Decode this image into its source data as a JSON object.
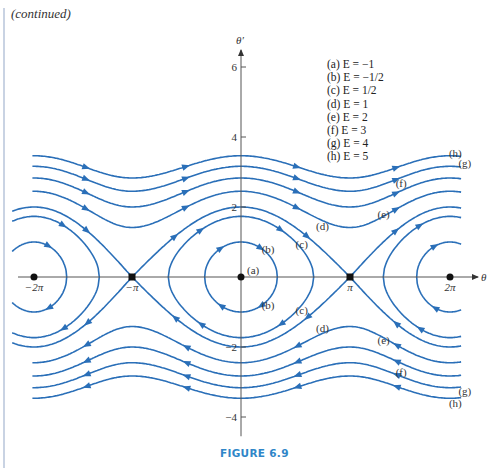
{
  "page": {
    "continued_label": "(continued)",
    "figure_caption": "FIGURE 6.9"
  },
  "colors": {
    "curve": "#2a6fb8",
    "axis": "#555555",
    "caption": "#2f86c8"
  },
  "chart_data": {
    "type": "line",
    "xlabel": "θ",
    "ylabel": "θ′",
    "xlim": [
      -6.6,
      6.9
    ],
    "ylim": [
      -4.6,
      6.6
    ],
    "x_ticks": [
      {
        "value": -6.2832,
        "label": "−2π"
      },
      {
        "value": -3.1416,
        "label": "−π"
      },
      {
        "value": 3.1416,
        "label": "π"
      },
      {
        "value": 6.2832,
        "label": "2π"
      }
    ],
    "y_ticks": [
      {
        "value": 6,
        "label": "6"
      },
      {
        "value": 4,
        "label": "4"
      },
      {
        "value": 2,
        "label": "2"
      },
      {
        "value": -2,
        "label": "−2"
      },
      {
        "value": -4,
        "label": "−4"
      }
    ],
    "equilibria": [
      {
        "theta": -6.2832,
        "theta_prime": 0,
        "label": ""
      },
      {
        "theta": -3.1416,
        "theta_prime": 0,
        "label": ""
      },
      {
        "theta": 0,
        "theta_prime": 0,
        "label": "(a)"
      },
      {
        "theta": 3.1416,
        "theta_prime": 0,
        "label": ""
      },
      {
        "theta": 6.2832,
        "theta_prime": 0,
        "label": ""
      }
    ],
    "legend": [
      {
        "key": "a",
        "text": "(a) E = −1"
      },
      {
        "key": "b",
        "text": "(b) E = −1/2"
      },
      {
        "key": "c",
        "text": "(c) E = 1/2"
      },
      {
        "key": "d",
        "text": "(d) E = 1"
      },
      {
        "key": "e",
        "text": "(e) E = 2"
      },
      {
        "key": "f",
        "text": "(f) E = 3"
      },
      {
        "key": "g",
        "text": "(g) E = 4"
      },
      {
        "key": "h",
        "text": "(h) E = 5"
      }
    ],
    "legend_position": "top-right",
    "series": [
      {
        "key": "a",
        "name": "(a)",
        "E": -1
      },
      {
        "key": "b",
        "name": "(b)",
        "E": -0.5
      },
      {
        "key": "c",
        "name": "(c)",
        "E": 0.5
      },
      {
        "key": "d",
        "name": "(d)",
        "E": 1
      },
      {
        "key": "e",
        "name": "(e)",
        "E": 2
      },
      {
        "key": "f",
        "name": "(f)",
        "E": 3
      },
      {
        "key": "g",
        "name": "(g)",
        "E": 4
      },
      {
        "key": "h",
        "name": "(h)",
        "E": 5
      }
    ],
    "curve_labels": [
      {
        "text": "(b)",
        "theta": 0.78,
        "theta_prime": 0.8
      },
      {
        "text": "(b)",
        "theta": 0.78,
        "theta_prime": -0.8
      },
      {
        "text": "(c)",
        "theta": 1.75,
        "theta_prime": 0.95
      },
      {
        "text": "(c)",
        "theta": 1.75,
        "theta_prime": -0.95
      },
      {
        "text": "(d)",
        "theta": 2.35,
        "theta_prime": 1.45
      },
      {
        "text": "(d)",
        "theta": 2.35,
        "theta_prime": -1.45
      },
      {
        "text": "(e)",
        "theta": 4.2,
        "theta_prime": 1.8
      },
      {
        "text": "(e)",
        "theta": 4.2,
        "theta_prime": -1.8
      },
      {
        "text": "(f)",
        "theta": 4.75,
        "theta_prime": 2.7
      },
      {
        "text": "(f)",
        "theta": 4.75,
        "theta_prime": -2.7
      },
      {
        "text": "(g)",
        "theta": 6.75,
        "theta_prime": 3.25
      },
      {
        "text": "(g)",
        "theta": 6.75,
        "theta_prime": -3.25
      },
      {
        "text": "(h)",
        "theta": 6.45,
        "theta_prime": 3.55
      },
      {
        "text": "(h)",
        "theta": 6.45,
        "theta_prime": -3.6
      }
    ],
    "grid": false
  }
}
